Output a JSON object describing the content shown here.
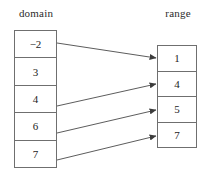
{
  "diagram": {
    "type": "mapping-diagram",
    "labels": {
      "domain": "domain",
      "range": "range"
    },
    "domain": {
      "items": [
        {
          "value": "−2"
        },
        {
          "value": "3"
        },
        {
          "value": "4"
        },
        {
          "value": "6"
        },
        {
          "value": "7"
        }
      ]
    },
    "range": {
      "items": [
        {
          "value": "1"
        },
        {
          "value": "4"
        },
        {
          "value": "5"
        },
        {
          "value": "7"
        }
      ]
    },
    "mappings": [
      {
        "from": "−2",
        "to": "1",
        "x1": 57,
        "y1": 43,
        "x2": 156,
        "y2": 58
      },
      {
        "from": "4",
        "to": "4",
        "x1": 57,
        "y1": 106,
        "x2": 156,
        "y2": 84
      },
      {
        "from": "6",
        "to": "5",
        "x1": 57,
        "y1": 133,
        "x2": 156,
        "y2": 110
      },
      {
        "from": "7",
        "to": "7",
        "x1": 57,
        "y1": 160,
        "x2": 156,
        "y2": 136
      }
    ],
    "colors": {
      "stroke": "#4a4a4a",
      "border": "#6f6f6f",
      "text": "#232323",
      "background": "#ffffff"
    }
  }
}
